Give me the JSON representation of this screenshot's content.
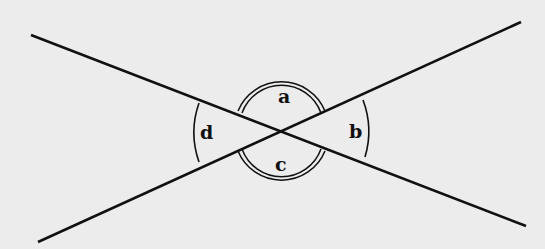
{
  "diagram": {
    "background": "#ececec",
    "stroke": "#111111",
    "intersection": [
      282,
      131
    ],
    "lines": [
      {
        "id": "line-1",
        "from": [
          31,
          35
        ],
        "to": [
          526,
          226
        ]
      },
      {
        "id": "line-2",
        "from": [
          38,
          242
        ],
        "to": [
          521,
          22
        ]
      }
    ],
    "angles": [
      {
        "label": "a",
        "position": "top",
        "arcs": 2
      },
      {
        "label": "b",
        "position": "right",
        "arcs": 1
      },
      {
        "label": "c",
        "position": "bottom",
        "arcs": 2
      },
      {
        "label": "d",
        "position": "left",
        "arcs": 1
      }
    ]
  }
}
